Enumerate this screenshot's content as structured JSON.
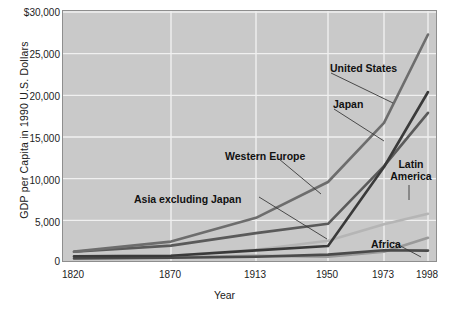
{
  "chart_data": {
    "type": "line",
    "title": "",
    "xlabel": "Year",
    "ylabel": "GDP per Capita in 1990 U.S. Dollars",
    "x": [
      1820,
      1870,
      1913,
      1950,
      1973,
      1998
    ],
    "xtick_labels": [
      "1820",
      "1870",
      "1913",
      "1950",
      "1973",
      "1998"
    ],
    "ytick_labels": [
      "$30,000",
      "25,000",
      "20,000",
      "15,000",
      "10,000",
      "5,000",
      "0"
    ],
    "yticks": [
      30000,
      25000,
      20000,
      15000,
      10000,
      5000,
      0
    ],
    "ylim": [
      0,
      30000
    ],
    "xlim": [
      1820,
      1998
    ],
    "grid": true,
    "legend": "annotations-on-plot",
    "plot_background": "#c9c9c9",
    "gridline_color": "#f0f0f0",
    "series": [
      {
        "name": "United States",
        "color": "#6d6d6d",
        "values": [
          1250,
          2450,
          5300,
          9600,
          16700,
          27300
        ]
      },
      {
        "name": "Japan",
        "color": "#3a3a3a",
        "values": [
          670,
          740,
          1390,
          1920,
          11400,
          20400
        ]
      },
      {
        "name": "Western Europe",
        "color": "#5a5a5a",
        "values": [
          1230,
          1970,
          3470,
          4590,
          11500,
          17900
        ]
      },
      {
        "name": "Latin America",
        "color": "#b5b5b5",
        "values": [
          690,
          760,
          1480,
          2550,
          4530,
          5800
        ]
      },
      {
        "name": "Asia excluding Japan",
        "color": "#9a9a9a",
        "values": [
          575,
          580,
          740,
          635,
          1230,
          2900
        ]
      },
      {
        "name": "Africa",
        "color": "#4a4a4a",
        "values": [
          420,
          500,
          640,
          890,
          1410,
          1370
        ]
      }
    ],
    "annotations": [
      {
        "label": "United States",
        "text_x": 330,
        "text_y": 62,
        "leader": [
          [
            330,
            72
          ],
          [
            392,
            102
          ]
        ]
      },
      {
        "label": "Japan",
        "text_x": 333,
        "text_y": 98,
        "leader": [
          [
            333,
            108
          ],
          [
            383,
            140
          ]
        ]
      },
      {
        "label": "Western Europe",
        "text_x": 225,
        "text_y": 150,
        "leader": [
          [
            278,
            158
          ],
          [
            320,
            193
          ]
        ]
      },
      {
        "label": "Asia excluding Japan",
        "text_x": 134,
        "text_y": 193,
        "leader": [
          [
            258,
            196
          ],
          [
            326,
            238
          ]
        ]
      },
      {
        "label": "Latin America",
        "text_x": 383,
        "text_y": 158,
        "leader": [
          [
            408,
            184
          ],
          [
            408,
            199
          ]
        ]
      },
      {
        "label": "Africa",
        "text_x": 371,
        "text_y": 238,
        "leader": [
          [
            392,
            241
          ],
          [
            420,
            256
          ]
        ]
      }
    ]
  }
}
